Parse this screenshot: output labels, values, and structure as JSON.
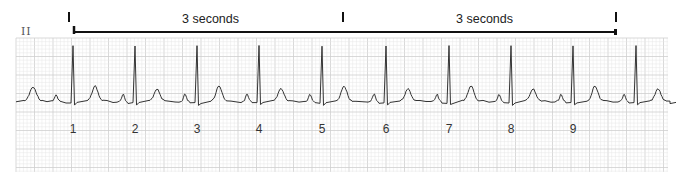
{
  "strip": {
    "lead_label": "II",
    "interval_labels": [
      "3 seconds",
      "3 seconds"
    ],
    "tick_marks_x": [
      69,
      343,
      616
    ],
    "colors": {
      "grid_minor": "#e6e6e6",
      "grid_major": "#cfcfcf",
      "trace": "#333333",
      "bracket": "#111111"
    },
    "grid": {
      "left": 16,
      "top": 38,
      "right": 668,
      "bottom": 172,
      "minor": 3.7,
      "major": 18.5
    },
    "baseline_y": 101,
    "beats": [
      {
        "number": "1",
        "r_x": 73
      },
      {
        "number": "2",
        "r_x": 135
      },
      {
        "number": "3",
        "r_x": 197
      },
      {
        "number": "4",
        "r_x": 259
      },
      {
        "number": "5",
        "r_x": 322
      },
      {
        "number": "6",
        "r_x": 386
      },
      {
        "number": "7",
        "r_x": 449
      },
      {
        "number": "8",
        "r_x": 511
      },
      {
        "number": "9",
        "r_x": 573
      },
      {
        "number": "",
        "r_x": 636
      }
    ]
  }
}
